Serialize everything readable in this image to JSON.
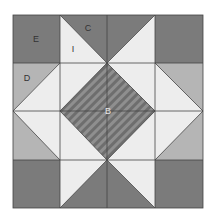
{
  "diagram": {
    "colors": {
      "dark": "#7b7b7b",
      "light_gray": "#b5b5b5",
      "white": "#ededed",
      "stripe_a": "#6e6e6e",
      "stripe_b": "#8f8f8f",
      "line": "#444444"
    },
    "labels": {
      "E": "E",
      "C": "C",
      "I": "I",
      "D": "D",
      "B": "B"
    }
  }
}
